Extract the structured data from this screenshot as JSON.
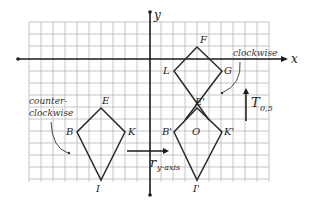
{
  "diagram": {
    "axes": {
      "x_label": "x",
      "y_label": "y"
    },
    "grid": {
      "cell_px": 12,
      "color": "#b8b8b8"
    },
    "original_kite": {
      "vertices": [
        {
          "name": "E",
          "label": "E"
        },
        {
          "name": "B",
          "label": "B"
        },
        {
          "name": "K",
          "label": "K"
        },
        {
          "name": "I",
          "label": "I"
        }
      ],
      "orientation_note": "counter-\nclockwise",
      "orientation_line1": "counter-",
      "orientation_line2": "clockwise"
    },
    "reflected_kite": {
      "vertices": [
        {
          "name": "E'",
          "label": "E'"
        },
        {
          "name": "B'",
          "label": "B'"
        },
        {
          "name": "K'",
          "label": "K'"
        },
        {
          "name": "I'",
          "label": "I'"
        }
      ],
      "origin_label": "O"
    },
    "translated_kite": {
      "vertices": [
        {
          "name": "F",
          "label": "F"
        },
        {
          "name": "L",
          "label": "L"
        },
        {
          "name": "G",
          "label": "G"
        }
      ],
      "orientation_note": "clockwise"
    },
    "transformations": {
      "reflection": {
        "symbol": "r",
        "subscript": "y-axis"
      },
      "translation": {
        "symbol": "T",
        "subscript": "0,5"
      }
    },
    "colors": {
      "axis": "#1a1a1a",
      "shape_stroke": "#2a2a2a",
      "grid": "#b8b8b8"
    }
  }
}
